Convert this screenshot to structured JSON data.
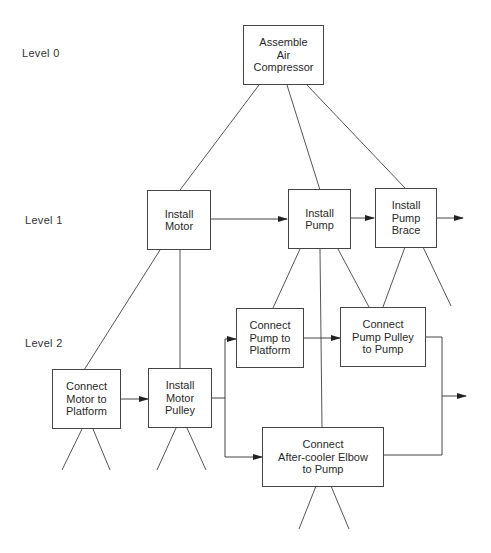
{
  "levels": [
    {
      "label": "Level 0"
    },
    {
      "label": "Level 1"
    },
    {
      "label": "Level 2"
    }
  ],
  "nodes": {
    "assemble_air_compressor": {
      "label": "Assemble\nAir\nCompressor",
      "level": 0
    },
    "install_motor": {
      "label": "Install\nMotor",
      "level": 1
    },
    "install_pump": {
      "label": "Install\nPump",
      "level": 1
    },
    "install_pump_brace": {
      "label": "Install\nPump\nBrace",
      "level": 1
    },
    "connect_motor_to_platform": {
      "label": "Connect\nMotor to\nPlatform",
      "level": 2
    },
    "install_motor_pulley": {
      "label": "Install\nMotor\nPulley",
      "level": 2
    },
    "connect_pump_to_platform": {
      "label": "Connect\nPump to\nPlatform",
      "level": 2
    },
    "connect_pump_pulley_to_pump": {
      "label": "Connect\nPump Pulley\nto Pump",
      "level": 2
    },
    "connect_after_cooler_elbow": {
      "label": "Connect\nAfter-cooler Elbow\nto Pump",
      "level": 2
    }
  },
  "hierarchy_edges": [
    [
      "assemble_air_compressor",
      "install_motor"
    ],
    [
      "assemble_air_compressor",
      "install_pump"
    ],
    [
      "assemble_air_compressor",
      "install_pump_brace"
    ],
    [
      "install_motor",
      "connect_motor_to_platform"
    ],
    [
      "install_motor",
      "install_motor_pulley"
    ],
    [
      "install_pump",
      "connect_pump_to_platform"
    ],
    [
      "install_pump",
      "connect_after_cooler_elbow"
    ],
    [
      "install_pump",
      "connect_pump_pulley_to_pump"
    ],
    [
      "install_pump_brace",
      "connect_pump_pulley_to_pump"
    ]
  ],
  "sequence_arrows": [
    [
      "install_motor",
      "install_pump"
    ],
    [
      "install_pump",
      "install_pump_brace"
    ],
    [
      "install_pump_brace",
      "next"
    ],
    [
      "connect_motor_to_platform",
      "install_motor_pulley"
    ],
    [
      "install_motor_pulley",
      "connect_pump_to_platform"
    ],
    [
      "install_motor_pulley",
      "connect_after_cooler_elbow"
    ],
    [
      "connect_pump_to_platform",
      "connect_pump_pulley_to_pump"
    ],
    [
      "connect_pump_pulley_to_pump",
      "next"
    ],
    [
      "connect_after_cooler_elbow",
      "next"
    ]
  ]
}
